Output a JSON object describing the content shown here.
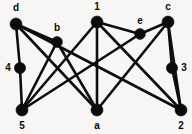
{
  "figure": {
    "background_color": "#f7f6f4",
    "node_color": "#0b0b0b",
    "edge_color": "#0d0d0d",
    "label_color": "#0a0a0a",
    "width": 192,
    "height": 134
  },
  "graph_data": {
    "type": "node-link-diagram",
    "directed": false,
    "node_count": 10,
    "edge_count": 17,
    "nodes": [
      {
        "id": "d",
        "label": "d",
        "x": 16,
        "y": 24,
        "r": 6.0,
        "label_x": 16,
        "label_y": 8
      },
      {
        "id": "b",
        "label": "b",
        "x": 57,
        "y": 42,
        "r": 5.4,
        "label_x": 57,
        "label_y": 28
      },
      {
        "id": "1",
        "label": "1",
        "x": 97,
        "y": 22,
        "r": 6.0,
        "label_x": 97,
        "label_y": 7
      },
      {
        "id": "e",
        "label": "e",
        "x": 140,
        "y": 34,
        "r": 5.4,
        "label_x": 140,
        "label_y": 21
      },
      {
        "id": "c",
        "label": "c",
        "x": 168,
        "y": 22,
        "r": 6.0,
        "label_x": 168,
        "label_y": 7
      },
      {
        "id": "4",
        "label": "4",
        "x": 20,
        "y": 68,
        "r": 5.6,
        "label_x": 8,
        "label_y": 68
      },
      {
        "id": "3",
        "label": "3",
        "x": 172,
        "y": 68,
        "r": 5.6,
        "label_x": 184,
        "label_y": 68
      },
      {
        "id": "5",
        "label": "5",
        "x": 22,
        "y": 110,
        "r": 6.0,
        "label_x": 22,
        "label_y": 126
      },
      {
        "id": "a",
        "label": "a",
        "x": 97,
        "y": 110,
        "r": 6.0,
        "label_x": 97,
        "label_y": 126
      },
      {
        "id": "2",
        "label": "2",
        "x": 181,
        "y": 110,
        "r": 6.0,
        "label_x": 181,
        "label_y": 126
      }
    ],
    "edges": [
      {
        "source": "d",
        "target": "4"
      },
      {
        "source": "d",
        "target": "b"
      },
      {
        "source": "d",
        "target": "a"
      },
      {
        "source": "d",
        "target": "2"
      },
      {
        "source": "4",
        "target": "5"
      },
      {
        "source": "5",
        "target": "b"
      },
      {
        "source": "5",
        "target": "1"
      },
      {
        "source": "5",
        "target": "e"
      },
      {
        "source": "b",
        "target": "a"
      },
      {
        "source": "1",
        "target": "a"
      },
      {
        "source": "1",
        "target": "2"
      },
      {
        "source": "1",
        "target": "e"
      },
      {
        "source": "a",
        "target": "c"
      },
      {
        "source": "e",
        "target": "c"
      },
      {
        "source": "c",
        "target": "3"
      },
      {
        "source": "c",
        "target": "2"
      },
      {
        "source": "3",
        "target": "2"
      }
    ]
  }
}
